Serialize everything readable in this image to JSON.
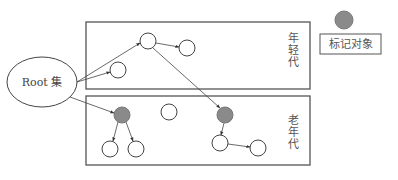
{
  "diagram": {
    "root": {
      "label": "Root 集",
      "cx": 42,
      "cy": 82,
      "rx": 35,
      "ry": 25
    },
    "legend": {
      "label": "标记对象",
      "dot": {
        "cx": 344,
        "cy": 20,
        "r": 9
      },
      "box": {
        "x": 320,
        "y": 34,
        "w": 61,
        "h": 20
      }
    },
    "regions": [
      {
        "id": "young",
        "label_chars": [
          "年",
          "轻",
          "代"
        ],
        "x": 86,
        "y": 22,
        "w": 224,
        "h": 67,
        "label_x": 293,
        "label_y": 42
      },
      {
        "id": "old",
        "label_chars": [
          "老",
          "年",
          "代"
        ],
        "x": 86,
        "y": 96,
        "w": 224,
        "h": 69,
        "label_x": 293,
        "label_y": 124
      }
    ],
    "nodes": [
      {
        "id": "y1",
        "cx": 148,
        "cy": 41,
        "r": 8,
        "marked": false
      },
      {
        "id": "y2",
        "cx": 187,
        "cy": 48,
        "r": 8,
        "marked": false
      },
      {
        "id": "y3",
        "cx": 118,
        "cy": 70,
        "r": 8,
        "marked": false
      },
      {
        "id": "o1",
        "cx": 122,
        "cy": 115,
        "r": 8,
        "marked": true
      },
      {
        "id": "o2",
        "cx": 169,
        "cy": 112,
        "r": 8,
        "marked": false
      },
      {
        "id": "o3",
        "cx": 110,
        "cy": 149,
        "r": 8,
        "marked": false
      },
      {
        "id": "o4",
        "cx": 136,
        "cy": 149,
        "r": 8,
        "marked": false
      },
      {
        "id": "o5",
        "cx": 225,
        "cy": 115,
        "r": 8,
        "marked": true
      },
      {
        "id": "o6",
        "cx": 220,
        "cy": 143,
        "r": 8,
        "marked": false
      },
      {
        "id": "o7",
        "cx": 258,
        "cy": 148,
        "r": 8,
        "marked": false
      }
    ],
    "edges": [
      {
        "from": "root",
        "to": "y1",
        "x1": 77,
        "y1": 82,
        "x2": 140,
        "y2": 43
      },
      {
        "from": "root",
        "to": "y3",
        "x1": 77,
        "y1": 82,
        "x2": 110,
        "y2": 72
      },
      {
        "from": "root",
        "to": "o1",
        "x1": 70,
        "y1": 97,
        "x2": 114,
        "y2": 113
      },
      {
        "from": "y1",
        "to": "y2",
        "x1": 156,
        "y1": 43,
        "x2": 179,
        "y2": 47
      },
      {
        "from": "y1",
        "to": "o5",
        "x1": 153,
        "y1": 48,
        "x2": 220,
        "y2": 108
      },
      {
        "from": "o1",
        "to": "o3",
        "x1": 118,
        "y1": 122,
        "x2": 113,
        "y2": 141
      },
      {
        "from": "o1",
        "to": "o4",
        "x1": 126,
        "y1": 122,
        "x2": 133,
        "y2": 141
      },
      {
        "from": "o5",
        "to": "o6",
        "x1": 224,
        "y1": 123,
        "x2": 221,
        "y2": 135
      },
      {
        "from": "o6",
        "to": "o7",
        "x1": 228,
        "y1": 144,
        "x2": 250,
        "y2": 147
      }
    ],
    "colors": {
      "stroke": "#444444",
      "box_stroke": "#555555",
      "marked_fill": "#8a8a8a",
      "node_fill": "#ffffff",
      "text": "#444444"
    }
  }
}
